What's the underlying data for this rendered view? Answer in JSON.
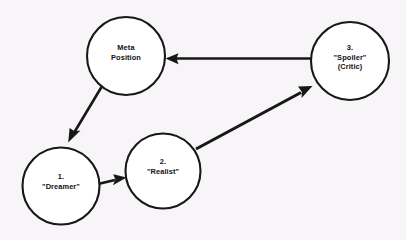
{
  "diagram": {
    "type": "cycle-diagram",
    "background_color": "#f7f5f7",
    "stroke_color": "#171717",
    "node_fill_color": "#ffffff",
    "nodes": [
      {
        "id": "meta",
        "name": "meta-position",
        "lines": [
          "Meta",
          "Position"
        ],
        "cx": 126,
        "cy": 56,
        "r": 39
      },
      {
        "id": "dreamer",
        "name": "dreamer",
        "lines": [
          "1.",
          "\"Dreamer\""
        ],
        "cx": 61,
        "cy": 186,
        "r": 38.5
      },
      {
        "id": "realist",
        "name": "realist",
        "lines": [
          "2.",
          "\"Realist\""
        ],
        "cx": 163,
        "cy": 171,
        "r": 37.5
      },
      {
        "id": "spoiler",
        "name": "spoiler-critic",
        "lines": [
          "3.",
          "\"Spoiler\"",
          "(Critic)"
        ],
        "cx": 350,
        "cy": 61,
        "r": 39
      }
    ],
    "edges": [
      {
        "id": "meta-to-dreamer",
        "name": "arrow-meta-to-dreamer",
        "from": "meta",
        "to": "dreamer",
        "label": "Meta Position to Dreamer"
      },
      {
        "id": "dreamer-to-realist",
        "name": "arrow-dreamer-to-realist",
        "from": "dreamer",
        "to": "realist",
        "label": "Dreamer to Realist"
      },
      {
        "id": "realist-to-spoiler",
        "name": "arrow-realist-to-spoiler",
        "from": "realist",
        "to": "spoiler",
        "label": "Realist to Spoiler (Critic)"
      },
      {
        "id": "spoiler-to-meta",
        "name": "arrow-spoiler-to-meta",
        "from": "spoiler",
        "to": "meta",
        "label": "Spoiler (Critic) to Meta Position"
      }
    ]
  }
}
